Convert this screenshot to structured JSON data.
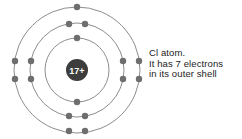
{
  "figure": {
    "background_color": "#ffffff"
  },
  "nucleus": {
    "label": "17+",
    "charge_number": 17,
    "center_x": 77,
    "center_y": 70,
    "radius": 11,
    "fill_color": "#3d3d3d",
    "text_color": "#ffffff"
  },
  "style": {
    "shell_stroke_color": "#8d8d8d",
    "electron_fill_color": "#6e6e6e",
    "caption_color": "#1c1c1c"
  },
  "caption": {
    "line1": "Cl atom.",
    "line2": "It has 7 electrons",
    "line3": "in its outer shell"
  },
  "chart_data": {
    "type": "diagram",
    "element_symbol": "Cl",
    "element_name": "Chlorine",
    "nucleus_label": "17+",
    "electron_configuration": [
      2,
      8,
      7
    ],
    "total_electrons": 17,
    "center": {
      "x": 77,
      "y": 70
    },
    "shells": [
      {
        "index": 1,
        "name": "inner-shell",
        "radius": 32,
        "electron_count": 2,
        "electrons": [
          {
            "x": 77,
            "y": 38
          },
          {
            "x": 77,
            "y": 102
          }
        ]
      },
      {
        "index": 2,
        "name": "middle-shell",
        "radius": 47,
        "electron_count": 8,
        "electrons": [
          {
            "x": 69,
            "y": 24
          },
          {
            "x": 85,
            "y": 24
          },
          {
            "x": 69,
            "y": 116
          },
          {
            "x": 85,
            "y": 116
          },
          {
            "x": 31,
            "y": 61
          },
          {
            "x": 31,
            "y": 79
          },
          {
            "x": 123,
            "y": 61
          },
          {
            "x": 123,
            "y": 79
          }
        ]
      },
      {
        "index": 3,
        "name": "outer-shell",
        "radius": 63,
        "electron_count": 7,
        "electrons": [
          {
            "x": 77,
            "y": 7
          },
          {
            "x": 69,
            "y": 131
          },
          {
            "x": 85,
            "y": 131
          },
          {
            "x": 15,
            "y": 61
          },
          {
            "x": 15,
            "y": 79
          },
          {
            "x": 139,
            "y": 61
          },
          {
            "x": 139,
            "y": 79
          }
        ]
      }
    ]
  }
}
